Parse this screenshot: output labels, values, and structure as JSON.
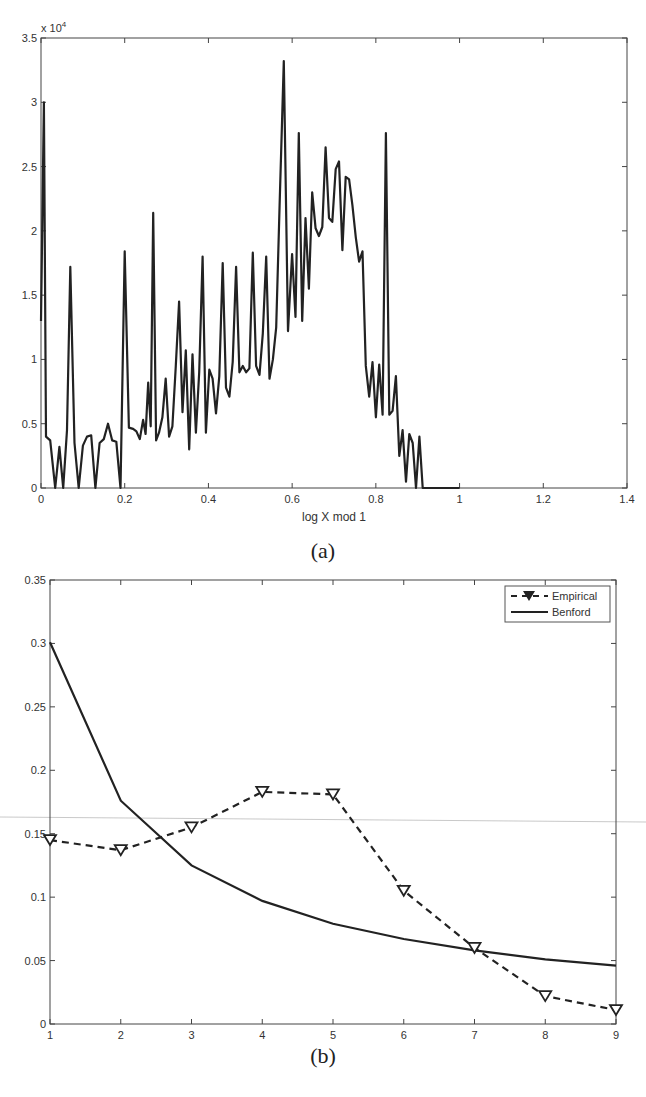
{
  "chart_data": [
    {
      "type": "line",
      "panel_caption": "(a)",
      "title": "",
      "xlabel": "log X mod 1",
      "ylabel": "",
      "y_multiplier_label": "x 10",
      "y_multiplier_exponent": "4",
      "xlim": [
        0,
        1.4
      ],
      "ylim": [
        0,
        3.5
      ],
      "x_ticks": [
        "0",
        "0.2",
        "0.4",
        "0.6",
        "0.8",
        "1",
        "1.2",
        "1.4"
      ],
      "y_ticks": [
        "0",
        "0.5",
        "1",
        "1.5",
        "2",
        "2.5",
        "3",
        "3.5"
      ],
      "grid": false,
      "series": [
        {
          "name": "count",
          "color": "#222222",
          "x": [
            0.0,
            0.007,
            0.012,
            0.022,
            0.034,
            0.044,
            0.053,
            0.062,
            0.07,
            0.08,
            0.09,
            0.1,
            0.11,
            0.12,
            0.13,
            0.14,
            0.15,
            0.16,
            0.17,
            0.18,
            0.19,
            0.2,
            0.21,
            0.22,
            0.228,
            0.236,
            0.244,
            0.25,
            0.256,
            0.262,
            0.268,
            0.275,
            0.282,
            0.29,
            0.298,
            0.306,
            0.314,
            0.322,
            0.33,
            0.338,
            0.346,
            0.354,
            0.362,
            0.37,
            0.378,
            0.386,
            0.394,
            0.402,
            0.41,
            0.418,
            0.426,
            0.434,
            0.442,
            0.45,
            0.458,
            0.466,
            0.474,
            0.482,
            0.49,
            0.498,
            0.506,
            0.514,
            0.522,
            0.53,
            0.538,
            0.546,
            0.554,
            0.562,
            0.57,
            0.58,
            0.59,
            0.6,
            0.608,
            0.616,
            0.624,
            0.632,
            0.64,
            0.648,
            0.656,
            0.664,
            0.672,
            0.68,
            0.688,
            0.696,
            0.704,
            0.712,
            0.72,
            0.728,
            0.736,
            0.744,
            0.752,
            0.76,
            0.768,
            0.776,
            0.784,
            0.792,
            0.8,
            0.808,
            0.816,
            0.824,
            0.832,
            0.84,
            0.848,
            0.856,
            0.864,
            0.872,
            0.88,
            0.888,
            0.896,
            0.904,
            0.912,
            0.92,
            0.928,
            0.936,
            0.944,
            0.952,
            0.96,
            0.968,
            0.976,
            0.984,
            0.992,
            1.0,
            1.006
          ],
          "y": [
            1.3,
            3.0,
            0.4,
            0.37,
            0.0,
            0.32,
            0.0,
            0.45,
            1.72,
            0.35,
            0.0,
            0.33,
            0.4,
            0.41,
            0.0,
            0.35,
            0.38,
            0.5,
            0.37,
            0.36,
            0.0,
            1.84,
            0.47,
            0.46,
            0.44,
            0.38,
            0.53,
            0.42,
            0.82,
            0.48,
            2.14,
            0.37,
            0.43,
            0.55,
            0.85,
            0.4,
            0.48,
            0.95,
            1.45,
            0.59,
            1.07,
            0.3,
            1.04,
            0.43,
            0.9,
            1.8,
            0.43,
            0.92,
            0.85,
            0.58,
            0.87,
            1.75,
            0.78,
            0.71,
            0.98,
            1.72,
            0.9,
            0.95,
            0.9,
            0.93,
            1.83,
            0.95,
            0.88,
            1.2,
            1.8,
            0.85,
            1.0,
            1.25,
            2.2,
            3.32,
            1.22,
            1.82,
            1.33,
            2.76,
            1.3,
            2.1,
            1.55,
            2.3,
            2.02,
            1.96,
            2.03,
            2.65,
            2.1,
            2.07,
            2.48,
            2.54,
            1.85,
            2.42,
            2.4,
            2.2,
            1.95,
            1.76,
            1.84,
            0.95,
            0.71,
            0.98,
            0.55,
            0.96,
            0.57,
            2.76,
            0.57,
            0.6,
            0.87,
            0.25,
            0.45,
            0.05,
            0.42,
            0.35,
            0.0,
            0.4,
            0.0,
            0.0,
            0.0,
            0.0,
            0.0,
            0.0,
            0.0,
            0.0,
            0.0,
            0.0,
            0.0,
            0.0
          ]
        }
      ]
    },
    {
      "type": "line",
      "panel_caption": "(b)",
      "title": "",
      "xlabel": "",
      "ylabel": "",
      "xlim": [
        1,
        9
      ],
      "ylim": [
        0,
        0.35
      ],
      "x_ticks": [
        "1",
        "2",
        "3",
        "4",
        "5",
        "6",
        "7",
        "8",
        "9"
      ],
      "y_ticks": [
        "0",
        "0.05",
        "0.1",
        "0.15",
        "0.2",
        "0.25",
        "0.3",
        "0.35"
      ],
      "grid": false,
      "legend_position": "upper right",
      "categories": [
        1,
        2,
        3,
        4,
        5,
        6,
        7,
        8,
        9
      ],
      "series": [
        {
          "name": "Empirical",
          "style": "dashed",
          "marker": "down-triangle",
          "color": "#222222",
          "values": [
            0.145,
            0.137,
            0.155,
            0.183,
            0.181,
            0.105,
            0.06,
            0.022,
            0.011
          ]
        },
        {
          "name": "Benford",
          "style": "solid",
          "marker": "none",
          "color": "#222222",
          "values": [
            0.301,
            0.176,
            0.125,
            0.097,
            0.079,
            0.067,
            0.058,
            0.051,
            0.046
          ]
        }
      ]
    }
  ]
}
